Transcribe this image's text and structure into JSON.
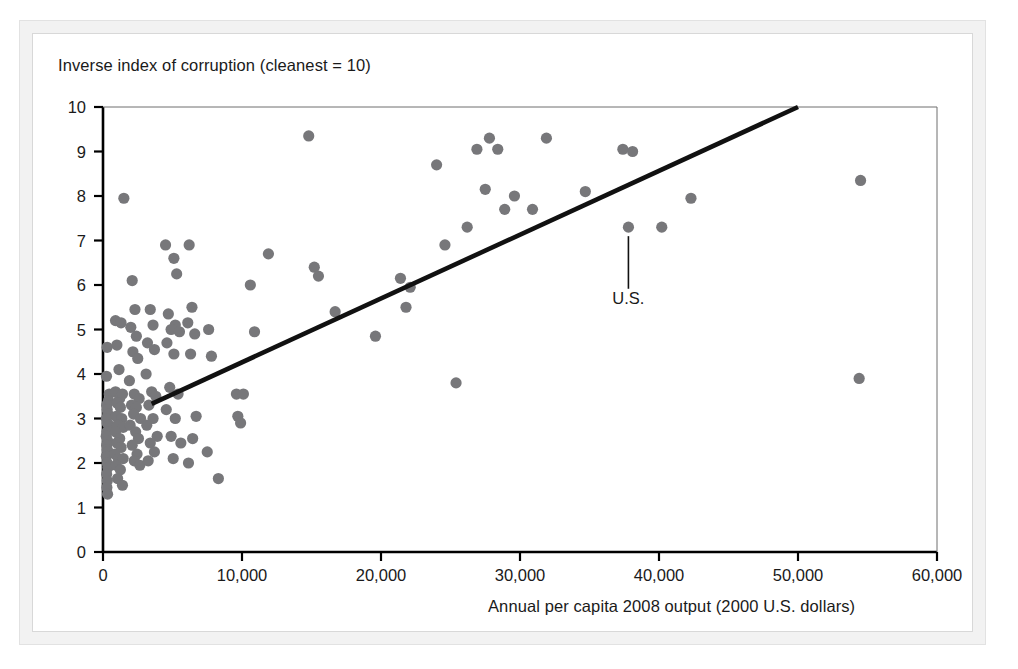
{
  "figure": {
    "title": "Inverse index of corruption (cleanest = 10)",
    "xlabel": "Annual per capita 2008 output (2000 U.S. dollars)",
    "annotation_label": "U.S.",
    "dot_color": "#77777a",
    "line_color": "#111111",
    "axis_color": "#000000",
    "frame_color": "#f2f2f2"
  },
  "chart_data": {
    "type": "scatter",
    "title": "Inverse index of corruption (cleanest = 10)",
    "xlabel": "Annual per capita 2008 output (2000 U.S. dollars)",
    "ylabel": "Inverse index of corruption (cleanest = 10)",
    "xlim": [
      0,
      60000
    ],
    "ylim": [
      0,
      10
    ],
    "xticks": [
      0,
      10000,
      20000,
      30000,
      40000,
      50000,
      60000
    ],
    "xticklabels": [
      "0",
      "10,000",
      "20,000",
      "30,000",
      "40,000",
      "50,000",
      "60,000"
    ],
    "yticks": [
      0,
      1,
      2,
      3,
      4,
      5,
      6,
      7,
      8,
      9,
      10
    ],
    "yticklabels": [
      "0",
      "1",
      "2",
      "3",
      "4",
      "5",
      "6",
      "7",
      "8",
      "9",
      "10"
    ],
    "grid": false,
    "legend": null,
    "annotations": [
      {
        "text": "U.S.",
        "x": 37800,
        "y": 7.3,
        "label_x": 37800,
        "label_y": 6.05
      }
    ],
    "trendline": {
      "type": "linear-fit",
      "x": [
        3500,
        50000
      ],
      "y": [
        3.33,
        10.0
      ]
    },
    "points": [
      {
        "x": 300,
        "y": 4.6
      },
      {
        "x": 1500,
        "y": 7.95
      },
      {
        "x": 250,
        "y": 3.95
      },
      {
        "x": 450,
        "y": 3.55
      },
      {
        "x": 400,
        "y": 3.4
      },
      {
        "x": 260,
        "y": 3.3
      },
      {
        "x": 300,
        "y": 3.2
      },
      {
        "x": 350,
        "y": 3.1
      },
      {
        "x": 250,
        "y": 3.0
      },
      {
        "x": 300,
        "y": 2.9
      },
      {
        "x": 420,
        "y": 2.85
      },
      {
        "x": 280,
        "y": 2.7
      },
      {
        "x": 230,
        "y": 2.6
      },
      {
        "x": 330,
        "y": 2.5
      },
      {
        "x": 260,
        "y": 2.4
      },
      {
        "x": 300,
        "y": 2.3
      },
      {
        "x": 380,
        "y": 2.25
      },
      {
        "x": 240,
        "y": 2.15
      },
      {
        "x": 300,
        "y": 2.0
      },
      {
        "x": 350,
        "y": 1.9
      },
      {
        "x": 260,
        "y": 1.75
      },
      {
        "x": 310,
        "y": 1.6
      },
      {
        "x": 280,
        "y": 1.45
      },
      {
        "x": 330,
        "y": 1.3
      },
      {
        "x": 900,
        "y": 5.2
      },
      {
        "x": 1300,
        "y": 5.15
      },
      {
        "x": 1000,
        "y": 4.65
      },
      {
        "x": 1150,
        "y": 4.1
      },
      {
        "x": 900,
        "y": 3.6
      },
      {
        "x": 1200,
        "y": 3.45
      },
      {
        "x": 1400,
        "y": 3.55
      },
      {
        "x": 1000,
        "y": 3.35
      },
      {
        "x": 1250,
        "y": 3.25
      },
      {
        "x": 950,
        "y": 3.05
      },
      {
        "x": 1350,
        "y": 3.0
      },
      {
        "x": 1050,
        "y": 2.85
      },
      {
        "x": 1450,
        "y": 2.8
      },
      {
        "x": 900,
        "y": 2.7
      },
      {
        "x": 1200,
        "y": 2.55
      },
      {
        "x": 1000,
        "y": 2.45
      },
      {
        "x": 1300,
        "y": 2.35
      },
      {
        "x": 850,
        "y": 2.2
      },
      {
        "x": 1100,
        "y": 2.1
      },
      {
        "x": 1450,
        "y": 2.1
      },
      {
        "x": 950,
        "y": 1.95
      },
      {
        "x": 1250,
        "y": 1.85
      },
      {
        "x": 1050,
        "y": 1.65
      },
      {
        "x": 1400,
        "y": 1.5
      },
      {
        "x": 2100,
        "y": 6.1
      },
      {
        "x": 2300,
        "y": 5.45
      },
      {
        "x": 2000,
        "y": 5.05
      },
      {
        "x": 2400,
        "y": 4.85
      },
      {
        "x": 2150,
        "y": 4.5
      },
      {
        "x": 2500,
        "y": 4.35
      },
      {
        "x": 1900,
        "y": 3.85
      },
      {
        "x": 2250,
        "y": 3.55
      },
      {
        "x": 2600,
        "y": 3.45
      },
      {
        "x": 2050,
        "y": 3.3
      },
      {
        "x": 2400,
        "y": 3.25
      },
      {
        "x": 2200,
        "y": 3.1
      },
      {
        "x": 2700,
        "y": 3.0
      },
      {
        "x": 1950,
        "y": 2.85
      },
      {
        "x": 2350,
        "y": 2.7
      },
      {
        "x": 2550,
        "y": 2.55
      },
      {
        "x": 2100,
        "y": 2.4
      },
      {
        "x": 2450,
        "y": 2.2
      },
      {
        "x": 2250,
        "y": 2.05
      },
      {
        "x": 2650,
        "y": 1.95
      },
      {
        "x": 3400,
        "y": 5.45
      },
      {
        "x": 3600,
        "y": 5.1
      },
      {
        "x": 3200,
        "y": 4.7
      },
      {
        "x": 3700,
        "y": 4.55
      },
      {
        "x": 3100,
        "y": 4.0
      },
      {
        "x": 3500,
        "y": 3.6
      },
      {
        "x": 3800,
        "y": 3.5
      },
      {
        "x": 3300,
        "y": 3.3
      },
      {
        "x": 3600,
        "y": 3.0
      },
      {
        "x": 3150,
        "y": 2.85
      },
      {
        "x": 3900,
        "y": 2.6
      },
      {
        "x": 3400,
        "y": 2.45
      },
      {
        "x": 3700,
        "y": 2.25
      },
      {
        "x": 3250,
        "y": 2.05
      },
      {
        "x": 4500,
        "y": 6.9
      },
      {
        "x": 5100,
        "y": 6.6
      },
      {
        "x": 5300,
        "y": 6.25
      },
      {
        "x": 4700,
        "y": 5.35
      },
      {
        "x": 5200,
        "y": 5.1
      },
      {
        "x": 4900,
        "y": 5.0
      },
      {
        "x": 5500,
        "y": 4.95
      },
      {
        "x": 4600,
        "y": 4.7
      },
      {
        "x": 5100,
        "y": 4.45
      },
      {
        "x": 4800,
        "y": 3.7
      },
      {
        "x": 5400,
        "y": 3.55
      },
      {
        "x": 4550,
        "y": 3.2
      },
      {
        "x": 5200,
        "y": 3.0
      },
      {
        "x": 4900,
        "y": 2.6
      },
      {
        "x": 5600,
        "y": 2.45
      },
      {
        "x": 5050,
        "y": 2.1
      },
      {
        "x": 6200,
        "y": 6.9
      },
      {
        "x": 6400,
        "y": 5.5
      },
      {
        "x": 6100,
        "y": 5.15
      },
      {
        "x": 6600,
        "y": 4.9
      },
      {
        "x": 6300,
        "y": 4.45
      },
      {
        "x": 6700,
        "y": 3.05
      },
      {
        "x": 6450,
        "y": 2.55
      },
      {
        "x": 6150,
        "y": 2.0
      },
      {
        "x": 7600,
        "y": 5.0
      },
      {
        "x": 7800,
        "y": 4.4
      },
      {
        "x": 7500,
        "y": 2.25
      },
      {
        "x": 8300,
        "y": 1.65
      },
      {
        "x": 9600,
        "y": 3.55
      },
      {
        "x": 10100,
        "y": 3.55
      },
      {
        "x": 9700,
        "y": 3.05
      },
      {
        "x": 9900,
        "y": 2.9
      },
      {
        "x": 10600,
        "y": 6.0
      },
      {
        "x": 10900,
        "y": 4.95
      },
      {
        "x": 11900,
        "y": 6.7
      },
      {
        "x": 14800,
        "y": 9.35
      },
      {
        "x": 16700,
        "y": 5.4
      },
      {
        "x": 15200,
        "y": 6.4
      },
      {
        "x": 15500,
        "y": 6.2
      },
      {
        "x": 19600,
        "y": 4.85
      },
      {
        "x": 21400,
        "y": 6.15
      },
      {
        "x": 21800,
        "y": 5.5
      },
      {
        "x": 22100,
        "y": 5.95
      },
      {
        "x": 24000,
        "y": 8.7
      },
      {
        "x": 24600,
        "y": 6.9
      },
      {
        "x": 25400,
        "y": 3.8
      },
      {
        "x": 26200,
        "y": 7.3
      },
      {
        "x": 26900,
        "y": 9.05
      },
      {
        "x": 27500,
        "y": 8.15
      },
      {
        "x": 27800,
        "y": 9.3
      },
      {
        "x": 28400,
        "y": 9.05
      },
      {
        "x": 28900,
        "y": 7.7
      },
      {
        "x": 29600,
        "y": 8.0
      },
      {
        "x": 30900,
        "y": 7.7
      },
      {
        "x": 31900,
        "y": 9.3
      },
      {
        "x": 34700,
        "y": 8.1
      },
      {
        "x": 37400,
        "y": 9.05
      },
      {
        "x": 38100,
        "y": 9.0
      },
      {
        "x": 37800,
        "y": 7.3
      },
      {
        "x": 40200,
        "y": 7.3
      },
      {
        "x": 42300,
        "y": 7.95
      },
      {
        "x": 54500,
        "y": 8.35
      },
      {
        "x": 54400,
        "y": 3.9
      }
    ]
  },
  "axis": {
    "y_tick_labels": [
      "10",
      "9",
      "8",
      "7",
      "6",
      "5",
      "4",
      "3",
      "2",
      "1",
      "0"
    ],
    "x_tick_labels": [
      "0",
      "10,000",
      "20,000",
      "30,000",
      "40,000",
      "50,000",
      "60,000"
    ]
  }
}
